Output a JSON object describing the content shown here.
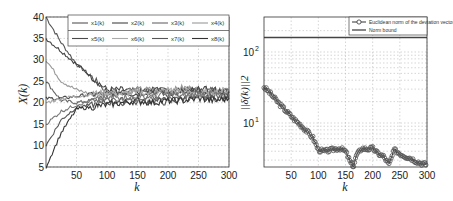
{
  "chart_data": [
    {
      "type": "line",
      "title": "",
      "xlabel": "k",
      "ylabel": "X(k)",
      "xlim": [
        0,
        300
      ],
      "ylim": [
        5,
        40
      ],
      "grid": true,
      "legend_position": "top-right",
      "xticks": [
        "50",
        "100",
        "150",
        "200",
        "250",
        "300"
      ],
      "yticks": [
        "5",
        "10",
        "15",
        "20",
        "25",
        "30",
        "35",
        "40"
      ],
      "legend": [
        "x1(k)",
        "x2(k)",
        "x3(k)",
        "x4(k)",
        "x5(k)",
        "x6(k)",
        "x7(k)",
        "x8(k)"
      ],
      "x": [
        0,
        25,
        50,
        75,
        100,
        125,
        150,
        175,
        200,
        225,
        250,
        275,
        300
      ],
      "series": [
        {
          "name": "x1(k)",
          "color": "#555555",
          "values": [
            40,
            34,
            29,
            26,
            22.5,
            22.5,
            23,
            22.5,
            23,
            23,
            22.5,
            23,
            22.5
          ]
        },
        {
          "name": "x2(k)",
          "color": "#444444",
          "values": [
            35,
            32,
            29,
            26,
            23,
            23,
            22.5,
            23,
            22,
            23,
            23,
            22,
            22.5
          ]
        },
        {
          "name": "x3(k)",
          "color": "#666666",
          "values": [
            25,
            20.5,
            20,
            20.5,
            21,
            20,
            21,
            21.5,
            21,
            21.5,
            22,
            21.5,
            21.5
          ]
        },
        {
          "name": "x4(k)",
          "color": "#999999",
          "values": [
            30,
            25,
            23,
            22,
            22,
            22.5,
            23,
            23,
            22.5,
            23.5,
            23,
            23,
            23
          ]
        },
        {
          "name": "x5(k)",
          "color": "#4a4a4a",
          "values": [
            21,
            21,
            21.5,
            22,
            22,
            22.5,
            22,
            23,
            22.5,
            22,
            23,
            23,
            22.5
          ]
        },
        {
          "name": "x6(k)",
          "color": "#aaaaaa",
          "values": [
            20,
            21,
            21.5,
            22,
            22.5,
            22,
            22.5,
            22,
            23,
            22.5,
            22,
            22.5,
            23
          ]
        },
        {
          "name": "x7(k)",
          "color": "#555555",
          "values": [
            10,
            16,
            19,
            19.5,
            20,
            20.5,
            20,
            20.5,
            20,
            21,
            21,
            21,
            21
          ]
        },
        {
          "name": "x8(k)",
          "color": "#333333",
          "values": [
            5,
            13,
            18.5,
            19,
            19.5,
            20,
            20.5,
            20,
            20.5,
            20.5,
            21,
            20.5,
            21
          ]
        },
        {
          "name": "x9(k)",
          "color": "#777777",
          "values": [
            15,
            18,
            19.5,
            20.5,
            21,
            21.5,
            21,
            21.5,
            22,
            21.5,
            22,
            22,
            21.5
          ]
        }
      ]
    },
    {
      "type": "line",
      "title": "",
      "xlabel": "k",
      "ylabel": "||δ(k)||2",
      "xlim": [
        0,
        300
      ],
      "ylim": [
        2,
        200
      ],
      "yscale": "log",
      "grid": true,
      "legend_position": "top-right",
      "xticks": [
        "50",
        "100",
        "150",
        "200",
        "250",
        "300"
      ],
      "yticks": [
        "10^1",
        "10^2"
      ],
      "legend": [
        "Euclidean norm of the deviation vector",
        "Norm bound"
      ],
      "series": [
        {
          "name": "Euclidean norm of the deviation vector",
          "marker": "circle",
          "color": "#333333",
          "x": [
            0,
            10,
            20,
            30,
            40,
            50,
            60,
            70,
            80,
            90,
            100,
            110,
            120,
            130,
            140,
            150,
            160,
            165,
            170,
            180,
            190,
            200,
            210,
            220,
            230,
            240,
            250,
            260,
            270,
            280,
            290,
            300
          ],
          "values": [
            32,
            27,
            22,
            18,
            15,
            12.5,
            10.5,
            9,
            7.5,
            6.2,
            4.2,
            4.0,
            4.1,
            4.3,
            4.4,
            4.0,
            2.7,
            2.5,
            3.5,
            4.4,
            4.3,
            4.4,
            3.7,
            3.4,
            2.6,
            4.2,
            3.7,
            3.4,
            3.2,
            2.9,
            2.7,
            2.6
          ]
        },
        {
          "name": "Norm bound",
          "color": "#444444",
          "x": [
            0,
            300
          ],
          "values": [
            160,
            160
          ]
        }
      ]
    }
  ]
}
